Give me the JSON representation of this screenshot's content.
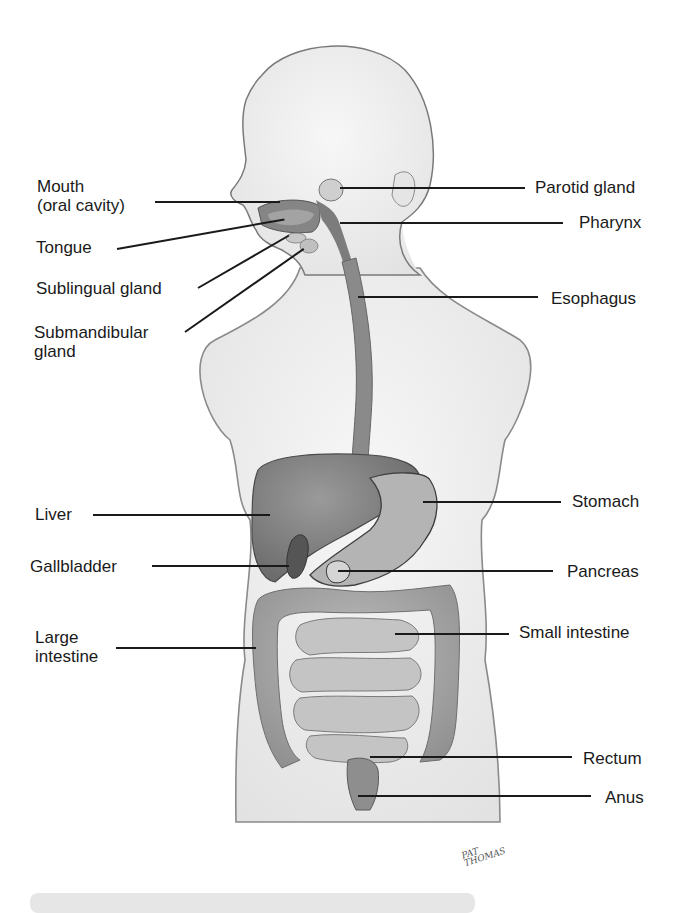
{
  "diagram": {
    "colors": {
      "body_fill": "#f1f1f1",
      "body_outline": "#7a7a7a",
      "organ_dark": "#6e6e6e",
      "organ_mid": "#8e8e8e",
      "organ_light": "#b0b0b0",
      "leader_line": "#1a1a1a",
      "caption_bar": "#e6e6e6"
    },
    "labels_left": [
      {
        "id": "mouth",
        "text_line1": "Mouth",
        "text_line2": "(oral cavity)"
      },
      {
        "id": "tongue",
        "text_line1": "Tongue"
      },
      {
        "id": "sublingual",
        "text_line1": "Sublingual gland"
      },
      {
        "id": "submandibular",
        "text_line1": "Submandibular",
        "text_line2": "gland"
      },
      {
        "id": "liver",
        "text_line1": "Liver"
      },
      {
        "id": "gallbladder",
        "text_line1": "Gallbladder"
      },
      {
        "id": "large-intestine",
        "text_line1": "Large",
        "text_line2": "intestine"
      }
    ],
    "labels_right": [
      {
        "id": "parotid",
        "text": "Parotid gland"
      },
      {
        "id": "pharynx",
        "text": "Pharynx"
      },
      {
        "id": "esophagus",
        "text": "Esophagus"
      },
      {
        "id": "stomach",
        "text": "Stomach"
      },
      {
        "id": "pancreas",
        "text": "Pancreas"
      },
      {
        "id": "small-intestine",
        "text": "Small intestine"
      },
      {
        "id": "rectum",
        "text": "Rectum"
      },
      {
        "id": "anus",
        "text": "Anus"
      }
    ],
    "signature": {
      "line1": "PAT",
      "line2": "THOMAS"
    }
  }
}
